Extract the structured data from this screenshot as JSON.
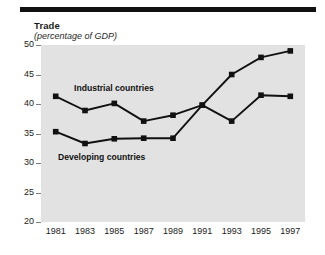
{
  "header": {
    "cutoff_text": "",
    "rule_color": "#111111"
  },
  "title": "Trade",
  "subtitle": "(percentage of GDP)",
  "series_labels": {
    "industrial": "Industrial countries",
    "developing": "Developing countries"
  },
  "axis": {
    "y_ticks": [
      "50",
      "45",
      "40",
      "35",
      "30",
      "25",
      "20"
    ],
    "x_ticks": [
      "1981",
      "1983",
      "1985",
      "1987",
      "1989",
      "1991",
      "1993",
      "1995",
      "1997"
    ]
  },
  "colors": {
    "plot_background": "#e2e2e2",
    "line": "#111111",
    "marker": "#111111",
    "page_background": "#ffffff",
    "tick": "#7d7d7d"
  },
  "chart_data": {
    "type": "line",
    "title": "Trade",
    "subtitle": "(percentage of GDP)",
    "xlabel": "",
    "ylabel": "",
    "x": [
      1981,
      1983,
      1985,
      1987,
      1989,
      1991,
      1993,
      1995,
      1997
    ],
    "xlim": [
      1980,
      1998
    ],
    "ylim": [
      20,
      50
    ],
    "ytick_values": [
      50,
      45,
      40,
      35,
      30,
      25,
      20
    ],
    "grid": false,
    "legend": "inline-annotations",
    "marker": "square",
    "series": [
      {
        "name": "Industrial countries",
        "values": [
          41.3,
          38.9,
          40.1,
          37.1,
          38.1,
          39.8,
          45.0,
          47.9,
          49.0
        ]
      },
      {
        "name": "Developing countries",
        "values": [
          35.3,
          33.3,
          34.1,
          34.2,
          34.2,
          39.8,
          37.1,
          41.5,
          41.3
        ]
      }
    ]
  }
}
